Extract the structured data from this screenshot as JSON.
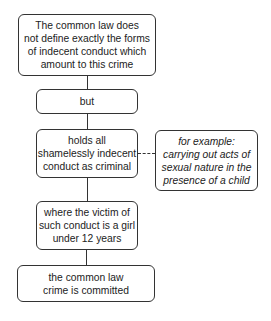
{
  "diagram": {
    "type": "flowchart",
    "nodes": [
      {
        "id": "n1",
        "text": "The common law does\nnot define exactly the forms\nof indecent conduct which\namount to this crime"
      },
      {
        "id": "n2",
        "text": "but"
      },
      {
        "id": "n3",
        "text": "holds all\nshamelessly indecent\nconduct as criminal"
      },
      {
        "id": "n4",
        "text": "for example:\ncarrying out acts of\nsexual nature in the\npresence of a child",
        "style": "italic"
      },
      {
        "id": "n5",
        "text": "where the victim of\nsuch conduct is a girl\nunder 12 years"
      },
      {
        "id": "n6",
        "text": "the common law\ncrime is committed"
      }
    ],
    "edges": [
      {
        "from": "n1",
        "to": "n2",
        "style": "solid"
      },
      {
        "from": "n2",
        "to": "n3",
        "style": "solid"
      },
      {
        "from": "n3",
        "to": "n4",
        "style": "dashed"
      },
      {
        "from": "n3",
        "to": "n5",
        "style": "solid"
      },
      {
        "from": "n5",
        "to": "n6",
        "style": "solid"
      }
    ]
  }
}
